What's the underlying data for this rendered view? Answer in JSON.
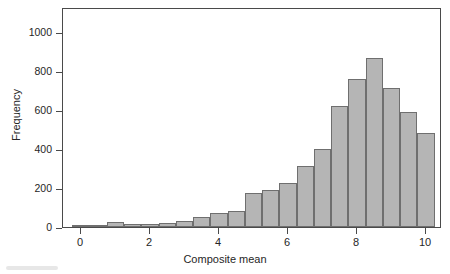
{
  "figure": {
    "axis_title_x": "Composite mean",
    "axis_title_y": "Frequency",
    "bar_fill": "#b5b5b5",
    "bar_stroke": "#6f6f6f",
    "frame_color": "#4a4a4a"
  },
  "chart_data": {
    "type": "bar",
    "title": "",
    "xlabel": "Composite mean",
    "ylabel": "Frequency",
    "xlim": [
      -0.4,
      10.4
    ],
    "ylim": [
      0,
      1100
    ],
    "grid": false,
    "legend": false,
    "bin_width": 0.5,
    "xticks": [
      "0",
      "2",
      "4",
      "6",
      "8",
      "10"
    ],
    "xtick_values": [
      0,
      2,
      4,
      6,
      8,
      10
    ],
    "yticks": [
      "0",
      "200",
      "400",
      "600",
      "800",
      "1000"
    ],
    "ytick_values": [
      0,
      200,
      400,
      600,
      800,
      1000
    ],
    "bin_centers": [
      0,
      0.5,
      1,
      1.5,
      2,
      2.5,
      3,
      3.5,
      4,
      4.5,
      5,
      5.5,
      6,
      6.5,
      7,
      7.5,
      8,
      8.5,
      9,
      9.5,
      10
    ],
    "categories": [
      "0",
      "0.5",
      "1",
      "1.5",
      "2",
      "2.5",
      "3",
      "3.5",
      "4",
      "4.5",
      "5",
      "5.5",
      "6",
      "6.5",
      "7",
      "7.5",
      "8",
      "8.5",
      "9",
      "9.5",
      "10"
    ],
    "values": [
      8,
      2,
      25,
      18,
      18,
      22,
      32,
      52,
      70,
      82,
      172,
      188,
      225,
      315,
      400,
      622,
      760,
      865,
      715,
      588,
      480
    ]
  }
}
